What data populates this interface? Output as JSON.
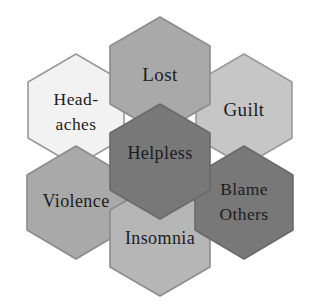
{
  "diagram": {
    "type": "honeycomb-cluster",
    "title": "",
    "background_color": "#ffffff",
    "text_color": "#1c1c1c",
    "cells": [
      {
        "id": "lost",
        "label": "Lost",
        "lines": [
          "Lost"
        ],
        "position": "top",
        "fill_color": "#a9a9a9",
        "border_color": "#8c8c8c",
        "cx": 160,
        "cy": 75,
        "radius": 58
      },
      {
        "id": "headaches",
        "label": "Head-aches",
        "lines": [
          "Head-",
          "aches"
        ],
        "position": "upper-left",
        "fill_color": "#f2f2f2",
        "border_color": "#9a9a9a",
        "cx": 76,
        "cy": 110,
        "radius": 56
      },
      {
        "id": "guilt",
        "label": "Guilt",
        "lines": [
          "Guilt"
        ],
        "position": "upper-right",
        "fill_color": "#c6c6c6",
        "border_color": "#9a9a9a",
        "cx": 244,
        "cy": 110,
        "radius": 56
      },
      {
        "id": "helpless",
        "label": "Helpless",
        "lines": [
          "Helpless"
        ],
        "position": "center",
        "fill_color": "#787878",
        "border_color": "#6a6a6a",
        "cx": 160,
        "cy": 155,
        "radius": 58
      },
      {
        "id": "violence",
        "label": "Violence",
        "lines": [
          "Violence"
        ],
        "position": "lower-left",
        "fill_color": "#a9a9a9",
        "border_color": "#8c8c8c",
        "cx": 76,
        "cy": 202,
        "radius": 57
      },
      {
        "id": "blame-others",
        "label": "Blame Others",
        "lines": [
          "Blame",
          "Others"
        ],
        "position": "lower-right",
        "fill_color": "#787878",
        "border_color": "#6a6a6a",
        "cx": 244,
        "cy": 202,
        "radius": 57
      },
      {
        "id": "insomnia",
        "label": "Insomnia",
        "lines": [
          "Insomnia"
        ],
        "position": "bottom",
        "fill_color": "#b6b6b6",
        "border_color": "#8c8c8c",
        "cx": 160,
        "cy": 238,
        "radius": 58
      }
    ]
  }
}
